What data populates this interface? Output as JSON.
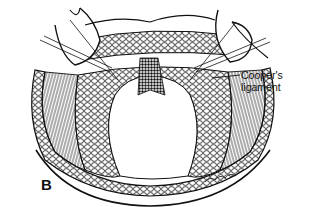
{
  "figure": {
    "panel_label": "B",
    "annotations": [
      {
        "text_line1": "Cooper's",
        "text_line2": "ligament",
        "target": "Cooper's ligament (right side)"
      }
    ],
    "signature": "illegible artist signature",
    "colors": {
      "ink": "#111111",
      "background": "#ffffff"
    }
  }
}
